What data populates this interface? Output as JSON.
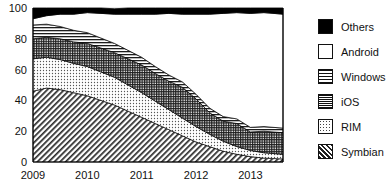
{
  "chart_data": {
    "type": "area",
    "title": "",
    "xlabel": "",
    "ylabel": "",
    "stacked": true,
    "normalized_percent": true,
    "grid": true,
    "legend_position": "right",
    "ylim": [
      0,
      100
    ],
    "yticks": [
      "0",
      "20",
      "40",
      "60",
      "80",
      "100"
    ],
    "ytick_values": [
      0,
      20,
      40,
      60,
      80,
      100
    ],
    "xticks": [
      "2009",
      "2010",
      "2011",
      "2012",
      "2013"
    ],
    "xtick_values": [
      2009,
      2010,
      2011,
      2012,
      2013
    ],
    "xlim": [
      2009,
      2013.6
    ],
    "x": [
      2009,
      2009.25,
      2009.5,
      2009.75,
      2010,
      2010.25,
      2010.5,
      2010.75,
      2011,
      2011.25,
      2011.5,
      2011.75,
      2012,
      2012.25,
      2012.5,
      2012.75,
      2013,
      2013.25,
      2013.6
    ],
    "stack_order_bottom_to_top": [
      "Symbian",
      "RIM",
      "iOS",
      "Windows",
      "Android",
      "Others"
    ],
    "series": [
      {
        "name": "Symbian",
        "pattern": "diagonal-hatch",
        "values": [
          46,
          48,
          47,
          45,
          43,
          40,
          37,
          33,
          29,
          25,
          21,
          17,
          13,
          10,
          7,
          5,
          3.5,
          2.5,
          2
        ]
      },
      {
        "name": "RIM",
        "pattern": "dots",
        "values": [
          21,
          20,
          19.5,
          19,
          19,
          18.5,
          18,
          17,
          16,
          14.5,
          13,
          11.5,
          10,
          8,
          6.5,
          5,
          4,
          3.5,
          3
        ]
      },
      {
        "name": "iOS",
        "pattern": "crosshatch-grid",
        "values": [
          13,
          13,
          13.5,
          14,
          15,
          15.5,
          16,
          17,
          18,
          18,
          18.5,
          20,
          18,
          14,
          13,
          15,
          12,
          14,
          14
        ]
      },
      {
        "name": "Windows",
        "pattern": "horizontal-lines",
        "values": [
          9,
          8.5,
          8,
          7.5,
          7,
          6.5,
          6,
          5.5,
          5,
          4.5,
          4,
          3.5,
          3,
          3,
          3,
          3,
          3,
          3,
          3
        ]
      },
      {
        "name": "Android",
        "pattern": "solid-white",
        "values": [
          4,
          5.5,
          8,
          10.5,
          13,
          16,
          19,
          23.5,
          28,
          34,
          40,
          44,
          52,
          61,
          67,
          69,
          74,
          74,
          74
        ]
      },
      {
        "name": "Others",
        "pattern": "solid-black",
        "values": [
          7,
          5,
          4,
          4,
          3,
          3.5,
          3.5,
          4,
          4,
          4,
          3.5,
          4,
          4,
          4,
          3.5,
          3,
          3.5,
          3,
          4
        ]
      }
    ]
  },
  "legend": {
    "items": [
      {
        "label": "Others",
        "swatch": "solid-black"
      },
      {
        "label": "Android",
        "swatch": "solid-white"
      },
      {
        "label": "Windows",
        "swatch": "horizontal-lines"
      },
      {
        "label": "iOS",
        "swatch": "crosshatch-grid"
      },
      {
        "label": "RIM",
        "swatch": "dots"
      },
      {
        "label": "Symbian",
        "swatch": "diagonal-hatch"
      }
    ]
  }
}
